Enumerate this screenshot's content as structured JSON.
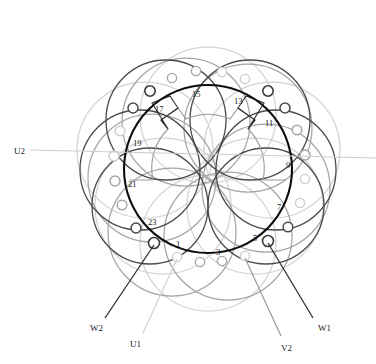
{
  "diagram": {
    "type": "motor-winding-diagram",
    "stator": {
      "center_x": 208,
      "center_y": 169,
      "outer_radius": 84,
      "bore_radius": 55,
      "outer_color": "#111111",
      "bore_color": "#9a9a9a"
    },
    "slot_labels": [
      {
        "text": "1",
        "x": 176,
        "y": 240
      },
      {
        "text": "3",
        "x": 216,
        "y": 248
      },
      {
        "text": "5",
        "x": 253,
        "y": 234
      },
      {
        "text": "7",
        "x": 277,
        "y": 203
      },
      {
        "text": "9",
        "x": 286,
        "y": 161
      },
      {
        "text": "11",
        "x": 265,
        "y": 119
      },
      {
        "text": "13",
        "x": 234,
        "y": 97
      },
      {
        "text": "15",
        "x": 192,
        "y": 90
      },
      {
        "text": "17",
        "x": 155,
        "y": 105
      },
      {
        "text": "19",
        "x": 133,
        "y": 139
      },
      {
        "text": "21",
        "x": 128,
        "y": 180
      },
      {
        "text": "23",
        "x": 148,
        "y": 218
      }
    ],
    "terminals": [
      {
        "name": "U1",
        "label": "U1",
        "x": 130,
        "y": 340,
        "color": "#cdcdcd"
      },
      {
        "name": "U2",
        "label": "U2",
        "x": 14,
        "y": 147,
        "color": "#cdcdcd"
      },
      {
        "name": "V2",
        "label": "V2",
        "x": 281,
        "y": 344,
        "color": "#9a9a9a"
      },
      {
        "name": "W1",
        "label": "W1",
        "x": 318,
        "y": 324,
        "color": "#3a3a3a"
      },
      {
        "name": "W2",
        "label": "W2",
        "x": 90,
        "y": 324,
        "color": "#3a3a3a"
      }
    ],
    "phase_colors": {
      "u_phase": "#cdcdcd",
      "v_phase": "#9a9a9a",
      "w_phase": "#3a3a3a",
      "core": "#111111"
    }
  }
}
